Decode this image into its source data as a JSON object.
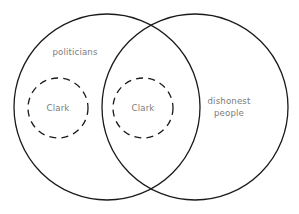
{
  "diagram": {
    "type": "venn",
    "canvas": {
      "width": 299,
      "height": 214,
      "background": "#ffffff"
    },
    "stroke_color": "#1a1a1a",
    "label_color": "#7b7b7b",
    "sets": [
      {
        "id": "politicians",
        "label": "politicians",
        "shape": "circle",
        "cx": 107,
        "cy": 107,
        "r": 93,
        "style": "solid"
      },
      {
        "id": "dishonest-people",
        "label": "dishonest\npeople",
        "shape": "circle",
        "cx": 195,
        "cy": 107,
        "r": 93,
        "style": "solid"
      }
    ],
    "subsets": [
      {
        "id": "clark-politicians-only",
        "label": "Clark",
        "shape": "circle",
        "cx": 58,
        "cy": 108,
        "r": 30,
        "style": "dashed"
      },
      {
        "id": "clark-intersection",
        "label": "Clark",
        "shape": "circle",
        "cx": 143,
        "cy": 108,
        "r": 30,
        "style": "dashed"
      }
    ],
    "labels": {
      "politicians": "politicians",
      "clark_left": "Clark",
      "clark_middle": "Clark",
      "dishonest_people": "dishonest\npeople"
    }
  }
}
